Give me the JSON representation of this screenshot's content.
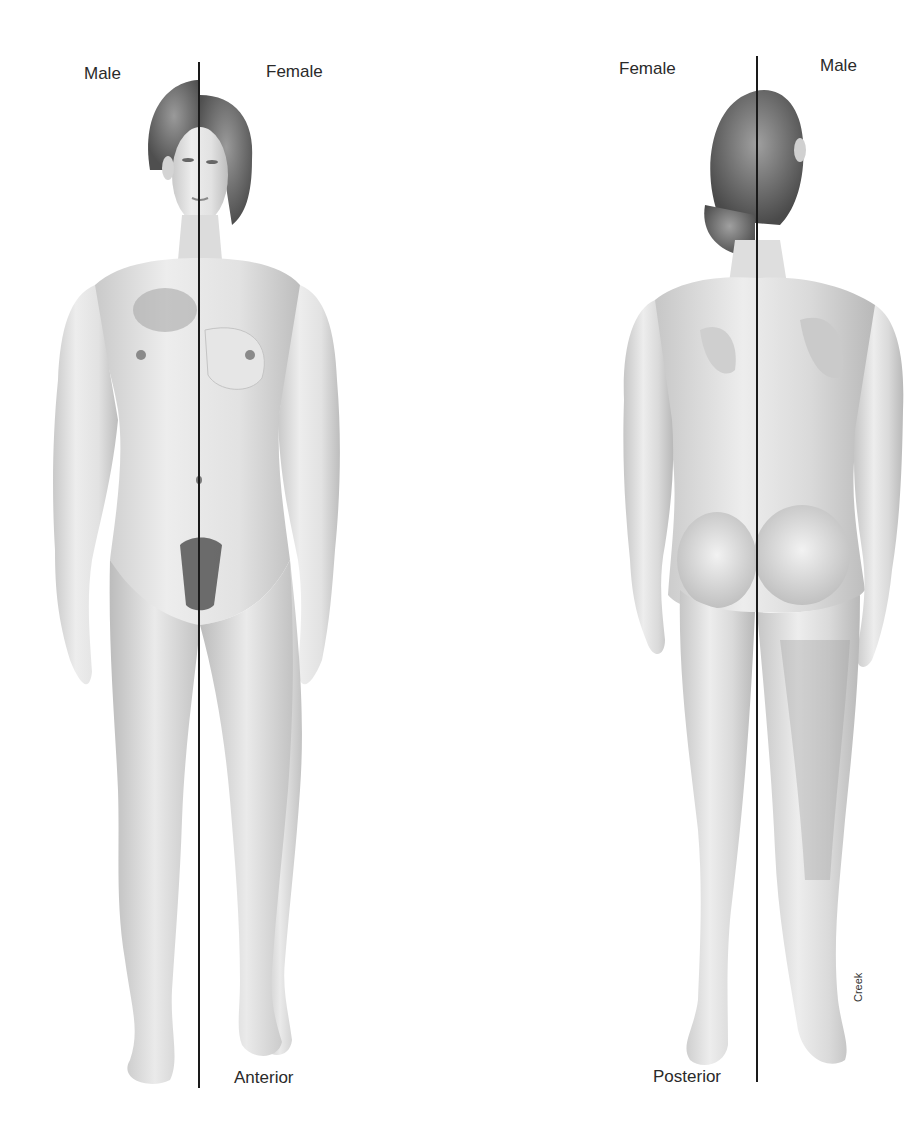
{
  "diagram": {
    "anterior_view": {
      "left_label": "Male",
      "right_label": "Female",
      "view_label": "Anterior"
    },
    "posterior_view": {
      "left_label": "Female",
      "right_label": "Male",
      "view_label": "Posterior"
    },
    "artist_signature": "Creek",
    "colors": {
      "background": "#ffffff",
      "line": "#1a1a1a",
      "skin_light": "#efefef",
      "skin_mid": "#d6d6d6",
      "skin_shadow": "#b5b5b5",
      "hair": "#6e6e6e",
      "text": "#2a2a2a"
    }
  }
}
